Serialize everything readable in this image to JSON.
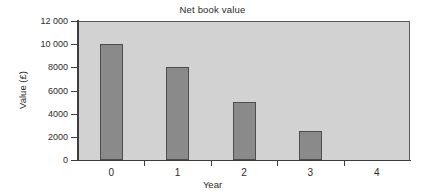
{
  "chart_data": {
    "type": "bar",
    "title": "Net book value",
    "xlabel": "Year",
    "ylabel": "Value (£)",
    "categories": [
      "0",
      "1",
      "2",
      "3",
      "4"
    ],
    "values": [
      10000,
      8000,
      5000,
      2500,
      0
    ],
    "ylim": [
      0,
      12000
    ],
    "ytick_values": [
      0,
      2000,
      4000,
      6000,
      8000,
      10000,
      12000
    ],
    "ytick_labels": [
      "0",
      "2000",
      "4000",
      "6000",
      "8000",
      "10 000",
      "12 000"
    ],
    "grid": false,
    "legend": false,
    "colors": {
      "bar_fill": "#8a8a8a",
      "bar_edge": "#4d4d4d",
      "plot_background": "#d2d2d2",
      "axis": "#3d3d3d",
      "text": "#2b2b2b",
      "figure_background": "#ffffff"
    }
  }
}
